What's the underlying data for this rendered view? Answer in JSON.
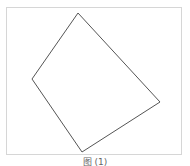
{
  "figure": {
    "shape": "quadrilateral",
    "vertices": [
      {
        "label": "top",
        "x": 78,
        "y": 13
      },
      {
        "label": "right",
        "x": 160,
        "y": 102
      },
      {
        "label": "bottom",
        "x": 82,
        "y": 152
      },
      {
        "label": "left",
        "x": 32,
        "y": 79
      }
    ],
    "stroke_color": "#555555",
    "frame_color": "#d6d6d6"
  },
  "caption": "图 (1)"
}
